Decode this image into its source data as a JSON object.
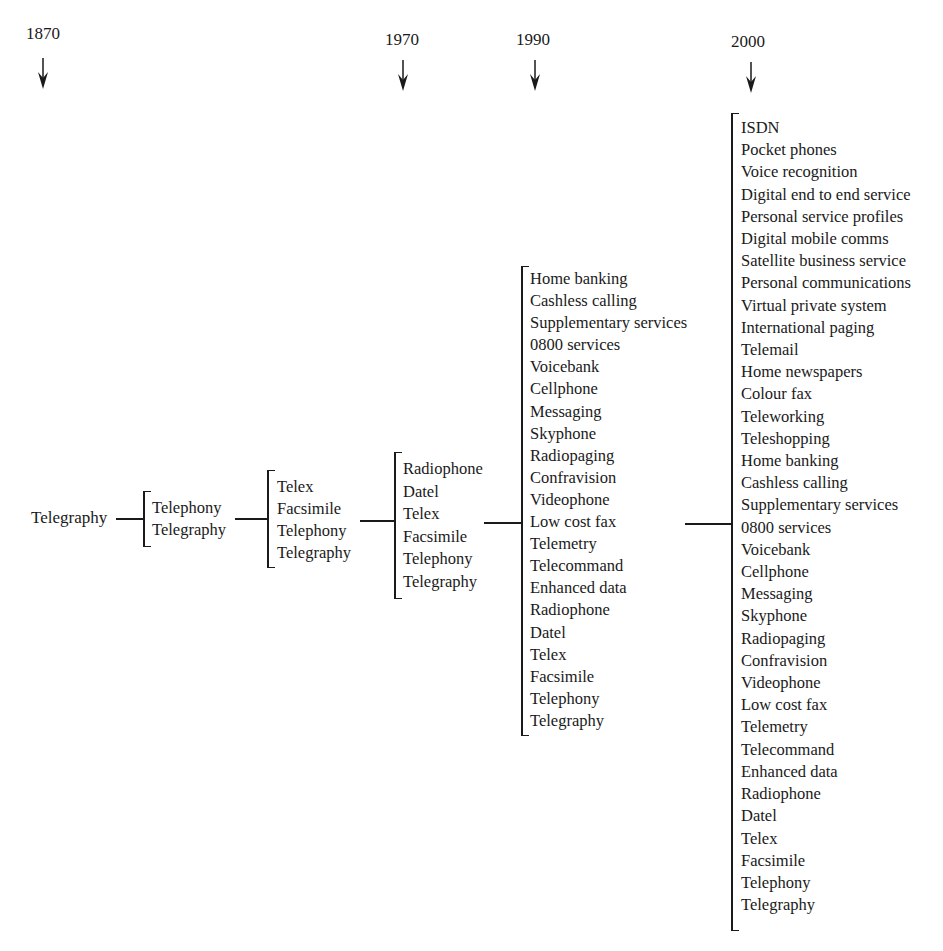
{
  "years": [
    {
      "label": "1870"
    },
    {
      "label": "1970"
    },
    {
      "label": "1990"
    },
    {
      "label": "2000"
    }
  ],
  "root": {
    "label": "Telegraphy"
  },
  "stages": [
    {
      "items": [
        "Telephony",
        "Telegraphy"
      ]
    },
    {
      "items": [
        "Telex",
        "Facsimile",
        "Telephony",
        "Telegraphy"
      ]
    },
    {
      "items": [
        "Radiophone",
        "Datel",
        "Telex",
        "Facsimile",
        "Telephony",
        "Telegraphy"
      ]
    },
    {
      "items": [
        "Home banking",
        "Cashless calling",
        "Supplementary services",
        "0800 services",
        "Voicebank",
        "Cellphone",
        "Messaging",
        "Skyphone",
        "Radiopaging",
        "Confravision",
        "Videophone",
        "Low cost fax",
        "Telemetry",
        "Telecommand",
        "Enhanced data",
        "Radiophone",
        "Datel",
        "Telex",
        "Facsimile",
        "Telephony",
        "Telegraphy"
      ]
    },
    {
      "items": [
        "ISDN",
        "Pocket phones",
        "Voice recognition",
        "Digital end to end service",
        "Personal service profiles",
        "Digital mobile comms",
        "Satellite business service",
        "Personal communications",
        "Virtual private system",
        "International paging",
        "Telemail",
        "Home newspapers",
        "Colour fax",
        "Teleworking",
        "Teleshopping",
        "Home banking",
        "Cashless calling",
        "Supplementary services",
        "0800 services",
        "Voicebank",
        "Cellphone",
        "Messaging",
        "Skyphone",
        "Radiopaging",
        "Confravision",
        "Videophone",
        "Low cost fax",
        "Telemetry",
        "Telecommand",
        "Enhanced data",
        "Radiophone",
        "Datel",
        "Telex",
        "Facsimile",
        "Telephony",
        "Telegraphy"
      ]
    }
  ],
  "icons": {
    "year_marker": "down-arrow-icon"
  }
}
